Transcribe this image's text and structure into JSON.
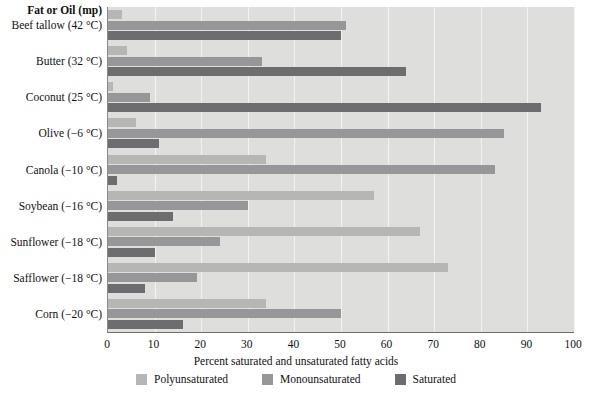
{
  "chart_data": {
    "type": "bar",
    "orientation": "horizontal",
    "title": "",
    "category_header": "Fat or Oil (mp)",
    "categories": [
      "Beef tallow (42 °C)",
      "Butter (32 °C)",
      "Coconut (25 °C)",
      "Olive (−6 °C)",
      "Canola (−10 °C)",
      "Soybean (−16 °C)",
      "Sunflower (−18 °C)",
      "Safflower (−18 °C)",
      "Corn (−20 °C)"
    ],
    "series": [
      {
        "name": "Polyunsaturated",
        "color": "#b6b6b4",
        "values": [
          3,
          4,
          1,
          6,
          34,
          57,
          67,
          73,
          34
        ]
      },
      {
        "name": "Monounsaturated",
        "color": "#97979a",
        "values": [
          51,
          33,
          9,
          85,
          83,
          30,
          24,
          19,
          50
        ]
      },
      {
        "name": "Saturated",
        "color": "#6d6d70",
        "values": [
          50,
          64,
          93,
          11,
          2,
          14,
          10,
          8,
          16
        ]
      }
    ],
    "xlabel": "Percent saturated and unsaturated fatty acids",
    "ylabel": "",
    "xlim": [
      0,
      100
    ],
    "xticks": [
      0,
      10,
      20,
      30,
      40,
      50,
      60,
      70,
      80,
      90,
      100
    ],
    "xtick_labels": [
      "0",
      "10",
      "20",
      "30",
      "40",
      "50",
      "60",
      "70",
      "80",
      "90",
      "100"
    ],
    "grid": true,
    "grid_axis": "x",
    "legend_position": "bottom",
    "legend_entries": [
      "Polyunsaturated",
      "Monounsaturated",
      "Saturated"
    ],
    "plot_background": "#dededc",
    "gridline_color": "#f2f2f0"
  }
}
